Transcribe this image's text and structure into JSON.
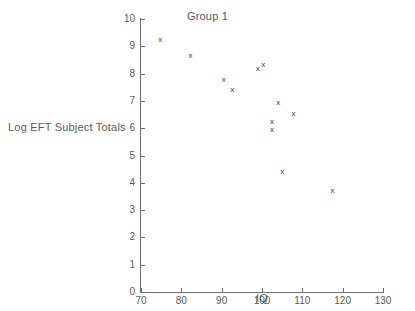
{
  "chart_data": {
    "type": "scatter",
    "title": "Group 1",
    "xlabel": "IQ",
    "ylabel": "Log EFT Subject Totals",
    "xlim": [
      70,
      130
    ],
    "ylim": [
      0,
      10
    ],
    "grid": false,
    "legend": null,
    "marker": "x",
    "marker_color": "#3a3a3a",
    "xticks": [
      70,
      80,
      90,
      100,
      110,
      120,
      130
    ],
    "yticks": [
      0,
      1,
      2,
      3,
      4,
      5,
      6,
      7,
      8,
      9,
      10
    ],
    "xtick_labels": [
      "70",
      "80",
      "90",
      "100",
      "110",
      "120",
      "130"
    ],
    "ytick_labels": [
      "0",
      "1",
      "2",
      "3",
      "4",
      "5",
      "6",
      "7",
      "8",
      "9",
      "10"
    ],
    "series": [
      {
        "name": "Group 1",
        "points": [
          {
            "x": 74.8,
            "y": 9.25
          },
          {
            "x": 82.3,
            "y": 8.65
          },
          {
            "x": 90.5,
            "y": 7.8
          },
          {
            "x": 92.6,
            "y": 7.4
          },
          {
            "x": 99.0,
            "y": 8.2
          },
          {
            "x": 100.3,
            "y": 8.35
          },
          {
            "x": 104.0,
            "y": 6.95
          },
          {
            "x": 102.5,
            "y": 6.25
          },
          {
            "x": 102.5,
            "y": 5.95
          },
          {
            "x": 107.8,
            "y": 6.55
          },
          {
            "x": 105.0,
            "y": 4.4
          },
          {
            "x": 117.5,
            "y": 3.7
          }
        ]
      }
    ]
  }
}
